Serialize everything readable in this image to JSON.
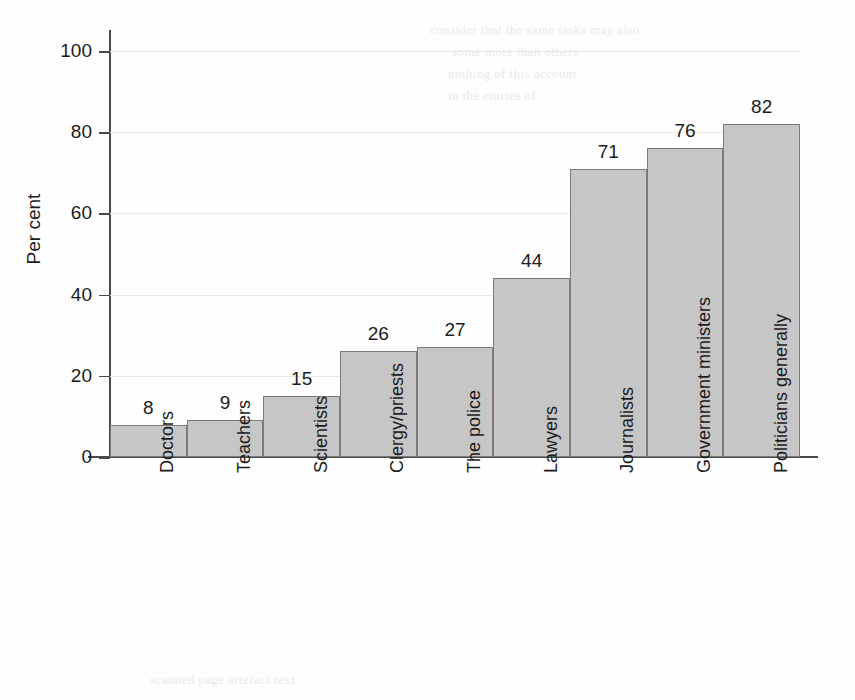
{
  "chart_data": {
    "type": "bar",
    "title": "",
    "xlabel": "",
    "ylabel": "Per cent",
    "ylim": [
      0,
      100
    ],
    "grid": true,
    "legend": "none",
    "orientation": "vertical",
    "categories": [
      "Doctors",
      "Teachers",
      "Scientists",
      "Clergy/priests",
      "The police",
      "Lawyers",
      "Journalists",
      "Government ministers",
      "Politicians generally"
    ],
    "values": [
      8,
      9,
      15,
      26,
      27,
      44,
      71,
      76,
      82
    ],
    "value_labels": [
      "8",
      "9",
      "15",
      "26",
      "27",
      "44",
      "71",
      "76",
      "82"
    ],
    "ytick_labels": [
      "0",
      "20",
      "40",
      "60",
      "80",
      "100"
    ],
    "ytick_values": [
      0,
      20,
      40,
      60,
      80,
      100
    ],
    "bar_color": "#c6c6c6",
    "bar_border_color": "#7b7b7b",
    "axis_color": "#4a4a4a",
    "grid_color": "#e9e9e9",
    "text_color": "#1c1c1c"
  },
  "background_bleed": {
    "line1": "consider that the same tasks may also",
    "line2": "some more than others",
    "line3": "nothing of this account",
    "line4": "in the entries of",
    "line5": "scanned page artefact text"
  }
}
